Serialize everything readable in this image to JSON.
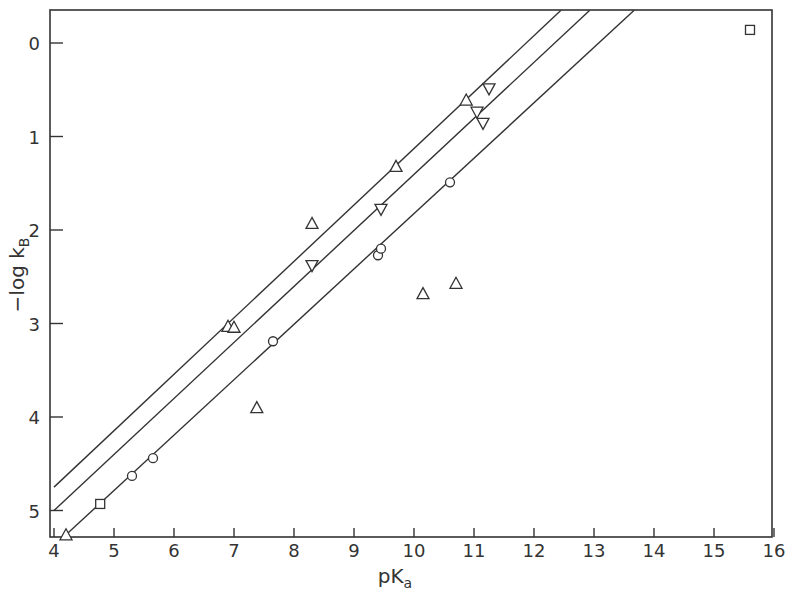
{
  "chart_data": {
    "type": "scatter",
    "title": "",
    "xlabel": "pKa",
    "xlabel_main": "pK",
    "xlabel_sub": "a",
    "ylabel": "-log kB",
    "ylabel_main": "−log k",
    "ylabel_sub": "B",
    "xlim": [
      4,
      16
    ],
    "ylim": [
      5.28,
      -0.35
    ],
    "y_inverted": true,
    "grid": false,
    "legend": "none",
    "x_ticks": [
      4,
      5,
      6,
      7,
      8,
      9,
      10,
      11,
      12,
      13,
      14,
      15,
      16
    ],
    "y_ticks": [
      0,
      1,
      2,
      3,
      4,
      5
    ],
    "series": [
      {
        "name": "triangle-up",
        "marker": "triangle-up",
        "points": [
          [
            4.2,
            5.26
          ],
          [
            6.9,
            3.03
          ],
          [
            7.0,
            3.04
          ],
          [
            7.38,
            3.9
          ],
          [
            8.3,
            1.93
          ],
          [
            9.7,
            1.32
          ],
          [
            10.15,
            2.68
          ],
          [
            10.7,
            2.57
          ],
          [
            10.87,
            0.61
          ]
        ]
      },
      {
        "name": "triangle-down",
        "marker": "triangle-down",
        "points": [
          [
            8.3,
            2.38
          ],
          [
            9.45,
            1.78
          ],
          [
            11.05,
            0.74
          ],
          [
            11.15,
            0.86
          ],
          [
            11.25,
            0.49
          ]
        ]
      },
      {
        "name": "circle",
        "marker": "circle",
        "points": [
          [
            5.3,
            4.63
          ],
          [
            5.65,
            4.44
          ],
          [
            7.65,
            3.19
          ],
          [
            9.4,
            2.27
          ],
          [
            9.45,
            2.2
          ],
          [
            10.6,
            1.49
          ]
        ]
      },
      {
        "name": "square",
        "marker": "square",
        "points": [
          [
            4.77,
            4.93
          ],
          [
            15.6,
            -0.14
          ]
        ]
      }
    ],
    "lines": [
      {
        "name": "line-1",
        "from": [
          4.0,
          4.75
        ],
        "to": [
          12.45,
          -0.35
        ]
      },
      {
        "name": "line-2",
        "from": [
          4.0,
          5.0
        ],
        "to": [
          12.93,
          -0.35
        ]
      },
      {
        "name": "line-3",
        "from": [
          4.2,
          5.26
        ],
        "to": [
          13.67,
          -0.35
        ]
      }
    ]
  }
}
